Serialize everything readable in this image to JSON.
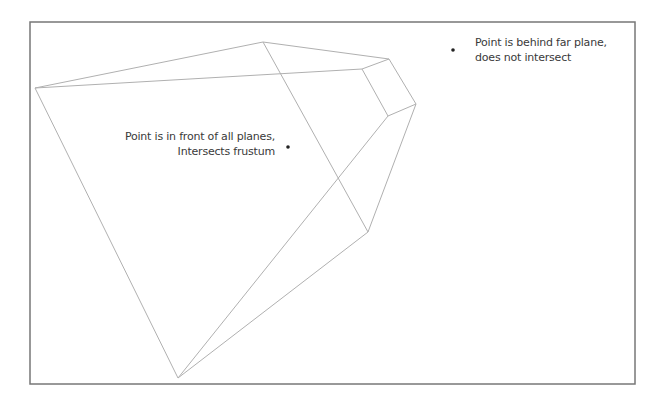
{
  "diagram": {
    "type": "frustum-intersection",
    "frame": {
      "x1": 30,
      "y1": 22,
      "x2": 635,
      "y2": 384,
      "color": "#777777"
    },
    "edge_color": "#b0b0b0",
    "vertices": {
      "near_left": [
        35,
        88
      ],
      "near_top": [
        263,
        42
      ],
      "near_bottom": [
        178,
        378
      ],
      "near_lower_right": [
        368,
        232
      ],
      "far_top": [
        389,
        59
      ],
      "far_left": [
        362,
        69
      ],
      "far_right": [
        416,
        104
      ],
      "far_bottom": [
        388,
        116
      ]
    },
    "edges": [
      [
        "near_left",
        "near_top"
      ],
      [
        "near_left",
        "far_left"
      ],
      [
        "near_top",
        "far_top"
      ],
      [
        "far_left",
        "far_top"
      ],
      [
        "far_top",
        "far_right"
      ],
      [
        "far_left",
        "far_bottom"
      ],
      [
        "far_bottom",
        "far_right"
      ],
      [
        "near_left",
        "near_bottom"
      ],
      [
        "near_top",
        "near_lower_right"
      ],
      [
        "far_right",
        "near_lower_right"
      ],
      [
        "near_bottom",
        "near_lower_right"
      ],
      [
        "near_bottom",
        "far_bottom"
      ]
    ],
    "points": [
      {
        "id": "inside-point",
        "x": 288,
        "y": 147,
        "label_lines": [
          "Point is in front of all planes,",
          "Intersects frustum"
        ]
      },
      {
        "id": "behind-point",
        "x": 453,
        "y": 50,
        "label_lines": [
          "Point is behind far plane,",
          "does not intersect"
        ]
      }
    ],
    "point_color": "#222222"
  }
}
